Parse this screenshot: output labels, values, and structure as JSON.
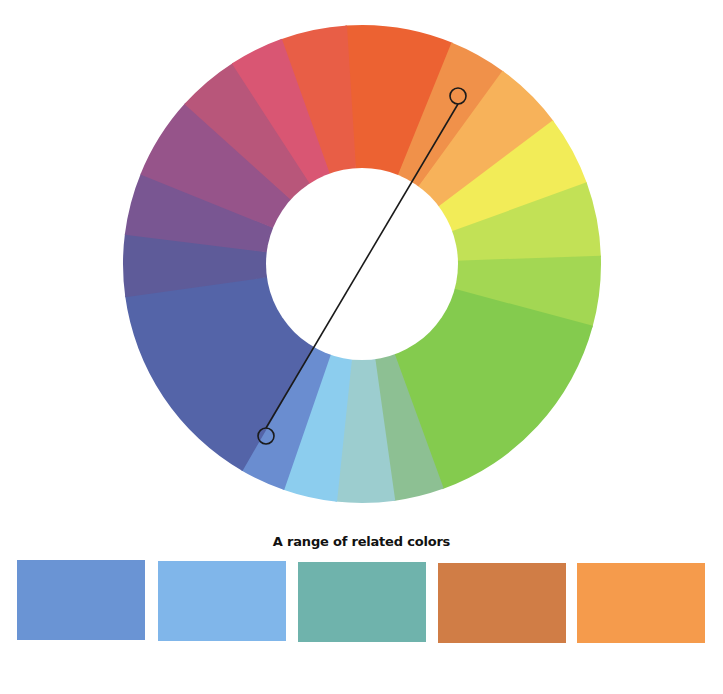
{
  "wheel": {
    "center": [
      362,
      264
    ],
    "outer_radius": 239,
    "inner_radius": 96,
    "segments": [
      {
        "name": "red",
        "start": 356,
        "end": 382,
        "color": "#ec6232"
      },
      {
        "name": "red-pink",
        "start": 340,
        "end": 356,
        "color": "#e85e46"
      },
      {
        "name": "orange",
        "start": 22,
        "end": 36,
        "color": "#f0914a"
      },
      {
        "name": "light-orange",
        "start": 36,
        "end": 53,
        "color": "#f7b25a"
      },
      {
        "name": "yellow",
        "start": 53,
        "end": 70,
        "color": "#f2ec58"
      },
      {
        "name": "yellow-green",
        "start": 70,
        "end": 88,
        "color": "#c2e156"
      },
      {
        "name": "lime-green",
        "start": 88,
        "end": 105,
        "color": "#a3d753"
      },
      {
        "name": "green",
        "start": 105,
        "end": 160,
        "color": "#84cb4e"
      },
      {
        "name": "sea-green",
        "start": 160,
        "end": 172,
        "color": "#8dc093"
      },
      {
        "name": "pale-teal",
        "start": 172,
        "end": 186,
        "color": "#9ccdcf"
      },
      {
        "name": "light-blue",
        "start": 186,
        "end": 199,
        "color": "#8ccdee"
      },
      {
        "name": "medium-blue",
        "start": 199,
        "end": 210,
        "color": "#6a8dd0"
      },
      {
        "name": "indigo",
        "start": 210,
        "end": 262,
        "color": "#5464a8"
      },
      {
        "name": "slate-violet",
        "start": 262,
        "end": 277,
        "color": "#5e5b99"
      },
      {
        "name": "purple",
        "start": 277,
        "end": 292,
        "color": "#795692"
      },
      {
        "name": "mauve",
        "start": 292,
        "end": 312,
        "color": "#96548a"
      },
      {
        "name": "rose",
        "start": 312,
        "end": 327,
        "color": "#b8567a"
      },
      {
        "name": "pink",
        "start": 327,
        "end": 340,
        "color": "#d95673"
      }
    ],
    "connector": {
      "from": [
        458,
        96
      ],
      "to": [
        266,
        436
      ],
      "handle_radius": 8,
      "color": "#1a1a1a"
    }
  },
  "caption": "A range of related colors",
  "swatches": [
    {
      "name": "medium-blue",
      "color": "#6a94d4",
      "x": 17,
      "y": 560
    },
    {
      "name": "light-blue",
      "color": "#80b6ea",
      "x": 158,
      "y": 561
    },
    {
      "name": "teal",
      "color": "#6fb3ac",
      "x": 298,
      "y": 562
    },
    {
      "name": "burnt-orange",
      "color": "#d07d46",
      "x": 438,
      "y": 563
    },
    {
      "name": "orange",
      "color": "#f59b4c",
      "x": 577,
      "y": 563
    }
  ]
}
